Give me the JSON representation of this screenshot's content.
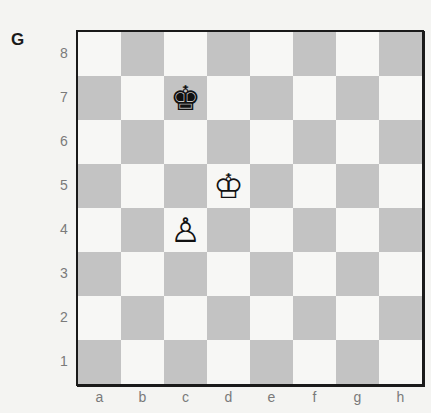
{
  "diagram": {
    "label": "G",
    "ranks": [
      "8",
      "7",
      "6",
      "5",
      "4",
      "3",
      "2",
      "1"
    ],
    "files": [
      "a",
      "b",
      "c",
      "d",
      "e",
      "f",
      "g",
      "h"
    ],
    "colors": {
      "light_square": "#f7f7f5",
      "dark_square": "#c3c3c3",
      "border": "#1a1a1a",
      "coordinate_text": "#7a7a7a"
    },
    "pieces": [
      {
        "square": "c7",
        "color": "black",
        "type": "king",
        "glyph": "♚"
      },
      {
        "square": "d5",
        "color": "white",
        "type": "king",
        "glyph": "♔"
      },
      {
        "square": "c4",
        "color": "white",
        "type": "pawn",
        "glyph": "♙"
      }
    ]
  }
}
